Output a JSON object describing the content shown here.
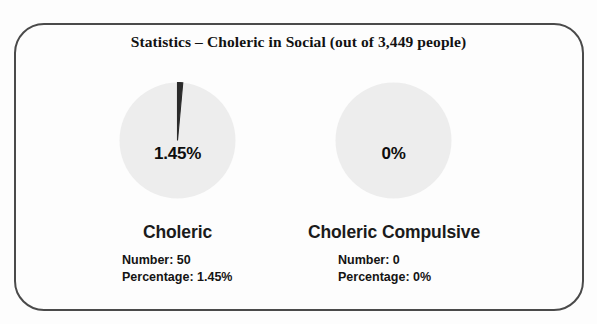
{
  "figure": {
    "title": "Statistics – Choleric in Social (out of 3,449 people)",
    "total_people": "3,449"
  },
  "charts": [
    {
      "name": "Choleric",
      "center_label": "1.45%",
      "number_line": "Number: 50",
      "percentage_line": "Percentage: 1.45%"
    },
    {
      "name": "Choleric Compulsive",
      "center_label": "0%",
      "number_line": "Number: 0",
      "percentage_line": "Percentage: 0%"
    }
  ],
  "colors": {
    "slice_highlight": "#2b2b2b",
    "slice_remainder": "#ededed",
    "frame_border": "#4a4a4a",
    "text": "#121212",
    "page_background": "#fdfdfd"
  },
  "chart_data": [
    {
      "type": "pie",
      "title": "Choleric",
      "labels": [
        "Choleric",
        "Remainder"
      ],
      "values": [
        1.45,
        98.55
      ],
      "counts": [
        50,
        3399
      ],
      "total": 3449,
      "unit": "%",
      "data_labels": [
        "1.45%"
      ],
      "legend": "none",
      "start_angle": 90,
      "direction": "clockwise"
    },
    {
      "type": "pie",
      "title": "Choleric Compulsive",
      "labels": [
        "Choleric Compulsive",
        "Remainder"
      ],
      "values": [
        0,
        100
      ],
      "counts": [
        0,
        3449
      ],
      "total": 3449,
      "unit": "%",
      "data_labels": [
        "0%"
      ],
      "legend": "none",
      "start_angle": 90,
      "direction": "clockwise"
    }
  ]
}
